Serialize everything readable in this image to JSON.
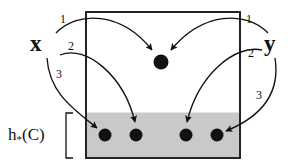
{
  "figure": {
    "type": "diagram",
    "background": "#ffffff",
    "ink_color": "#111111",
    "shaded_color": "#c9c9c9",
    "box": {
      "name": "outer-box",
      "x": 86,
      "y": 12,
      "width": 154,
      "height": 146,
      "border_color": "#1a1a1a",
      "border_width": 1.5,
      "fill": "#ffffff"
    },
    "shaded_band": {
      "name": "shaded-band",
      "x": 86,
      "y": 113,
      "width": 154,
      "height": 45,
      "fill": "#c9c9c9",
      "label": "h*(C)"
    },
    "labels": {
      "x": "x",
      "y": "y",
      "h_base": "h",
      "h_sub": "*",
      "h_arg": "(C)"
    },
    "edge_numbers": {
      "left": [
        "1",
        "2",
        "3"
      ],
      "right": [
        "1",
        "2",
        "3"
      ]
    },
    "nodes": [
      {
        "id": "center-node",
        "cx": 161,
        "cy": 62,
        "r": 7.5,
        "fill": "#111111",
        "region": "upper"
      },
      {
        "id": "band-node-1",
        "cx": 105,
        "cy": 135,
        "r": 6.5,
        "fill": "#111111",
        "region": "band"
      },
      {
        "id": "band-node-2",
        "cx": 136,
        "cy": 135,
        "r": 6.5,
        "fill": "#111111",
        "region": "band"
      },
      {
        "id": "band-node-3",
        "cx": 186,
        "cy": 135,
        "r": 6.5,
        "fill": "#111111",
        "region": "band"
      },
      {
        "id": "band-node-4",
        "cx": 217,
        "cy": 135,
        "r": 6.5,
        "fill": "#111111",
        "region": "band"
      }
    ],
    "arrows": [
      {
        "id": "arrow-x-1",
        "source": "x",
        "number": "1",
        "target": "center-node"
      },
      {
        "id": "arrow-x-2",
        "source": "x",
        "number": "2",
        "target": "band-node-2"
      },
      {
        "id": "arrow-x-3",
        "source": "x",
        "number": "3",
        "target": "band-node-1"
      },
      {
        "id": "arrow-y-1",
        "source": "y",
        "number": "1",
        "target": "center-node"
      },
      {
        "id": "arrow-y-2",
        "source": "y",
        "number": "2",
        "target": "band-node-3"
      },
      {
        "id": "arrow-y-3",
        "source": "y",
        "number": "3",
        "target": "band-node-4"
      }
    ],
    "brace": {
      "name": "band-brace",
      "x": 66,
      "y_top": 113,
      "y_bottom": 158,
      "width": 7
    },
    "label_positions": {
      "x": {
        "left": 30,
        "top": 32
      },
      "y": {
        "left": 264,
        "top": 32
      },
      "h": {
        "left": 8,
        "top": 126
      },
      "left_1": {
        "left": 60,
        "top": 13
      },
      "left_2": {
        "left": 68,
        "top": 40
      },
      "left_3": {
        "left": 56,
        "top": 68
      },
      "right_1": {
        "left": 246,
        "top": 13
      },
      "right_2": {
        "left": 248,
        "top": 47
      },
      "right_3": {
        "left": 256,
        "top": 89
      }
    }
  }
}
